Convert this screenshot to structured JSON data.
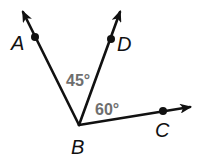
{
  "diagram": {
    "type": "angle-diagram",
    "vertex": {
      "label": "B",
      "x": 79,
      "y": 125,
      "label_x": 71,
      "label_y": 154
    },
    "rays": [
      {
        "name": "BA",
        "end_x": 23,
        "end_y": 12,
        "point": {
          "label": "A",
          "x": 35,
          "y": 37,
          "label_x": 11,
          "label_y": 50
        }
      },
      {
        "name": "BD",
        "end_x": 120,
        "end_y": 12,
        "point": {
          "label": "D",
          "x": 111,
          "y": 39,
          "label_x": 117,
          "label_y": 51
        }
      },
      {
        "name": "BC",
        "end_x": 190,
        "end_y": 107,
        "point": {
          "label": "C",
          "x": 163,
          "y": 111,
          "label_x": 155,
          "label_y": 137
        }
      }
    ],
    "angles": [
      {
        "name": "angle-ABD",
        "label": "45°",
        "x": 66,
        "y": 86
      },
      {
        "name": "angle-DBC",
        "label": "60°",
        "x": 95,
        "y": 115
      }
    ],
    "colors": {
      "line": "#111111",
      "angle_text": "#6e6e6e",
      "background": "#ffffff"
    }
  }
}
